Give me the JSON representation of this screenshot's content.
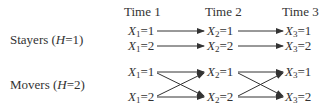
{
  "headers": [
    "Time 1",
    "Time 2",
    "Time 3"
  ],
  "groups": [
    {
      "label_prefix": "Stayers (",
      "label_var": "H",
      "label_suffix": "=1)",
      "pattern": "parallel",
      "nodes": [
        [
          {
            "var": "X",
            "sub": "1",
            "val": "=1"
          },
          {
            "var": "X",
            "sub": "1",
            "val": "=2"
          }
        ],
        [
          {
            "var": "X",
            "sub": "2",
            "val": "=1"
          },
          {
            "var": "X",
            "sub": "2",
            "val": "=2"
          }
        ],
        [
          {
            "var": "X",
            "sub": "3",
            "val": "=1"
          },
          {
            "var": "X",
            "sub": "3",
            "val": "=2"
          }
        ]
      ]
    },
    {
      "label_prefix": "Movers (",
      "label_var": "H",
      "label_suffix": "=2)",
      "pattern": "crossed",
      "nodes": [
        [
          {
            "var": "X",
            "sub": "1",
            "val": "=1"
          },
          {
            "var": "X",
            "sub": "1",
            "val": "=2"
          }
        ],
        [
          {
            "var": "X",
            "sub": "2",
            "val": "=1"
          },
          {
            "var": "X",
            "sub": "2",
            "val": "=2"
          }
        ],
        [
          {
            "var": "X",
            "sub": "3",
            "val": "=1"
          },
          {
            "var": "X",
            "sub": "3",
            "val": "=2"
          }
        ]
      ]
    }
  ],
  "colors": {
    "text": "#333333",
    "arrow": "#333333",
    "background": "#ffffff"
  }
}
